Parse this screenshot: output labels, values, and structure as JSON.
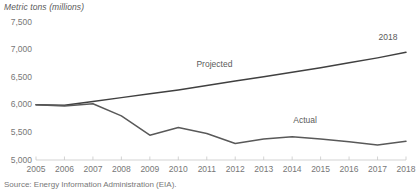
{
  "chart_data": {
    "type": "line",
    "title": "",
    "ylabel": "Metric tons (millions)",
    "xlabel": "",
    "ylim": [
      5000,
      7500
    ],
    "yticks": [
      "5,000",
      "5,500",
      "6,000",
      "6,500",
      "7,000",
      "7,500"
    ],
    "ytick_values": [
      5000,
      5500,
      6000,
      6500,
      7000,
      7500
    ],
    "grid": false,
    "legend": "inline-labels",
    "x": [
      2005,
      2006,
      2007,
      2008,
      2009,
      2010,
      2011,
      2012,
      2013,
      2014,
      2015,
      2016,
      2017,
      2018
    ],
    "categories": [
      "2005",
      "2006",
      "2007",
      "2008",
      "2009",
      "2010",
      "2011",
      "2012",
      "2013",
      "2014",
      "2015",
      "2016",
      "2017",
      "2018"
    ],
    "series": [
      {
        "name": "Projected",
        "color": "#404040",
        "values": [
          6000,
          5990,
          6060,
          6130,
          6200,
          6270,
          6350,
          6430,
          6510,
          6590,
          6670,
          6760,
          6850,
          6950
        ]
      },
      {
        "name": "Actual",
        "color": "#595959",
        "values": [
          6000,
          5980,
          6020,
          5800,
          5450,
          5590,
          5480,
          5300,
          5380,
          5420,
          5380,
          5330,
          5270,
          5340
        ]
      }
    ],
    "annotations": [
      {
        "text": "Projected",
        "x": 2011.2,
        "y": 6720
      },
      {
        "text": "Actual",
        "x": 2014.6,
        "y": 5700
      },
      {
        "text": "2018",
        "x": 2017.6,
        "y": 7210
      }
    ],
    "source": "Source: Energy Information Administration (EIA)."
  }
}
